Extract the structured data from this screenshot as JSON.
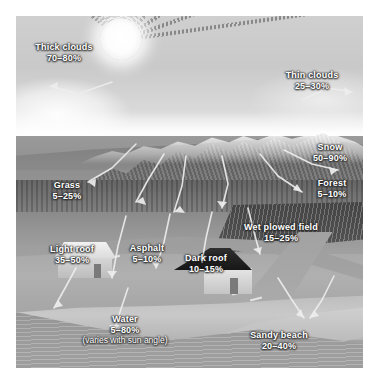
{
  "figure": {
    "top_remnant": "",
    "top_remnant_right": "",
    "sun_name": "sun",
    "sky_name": "sky"
  },
  "labels": [
    {
      "id": "thick-clouds",
      "title": "Thick clouds",
      "value": "70–80%",
      "note": "",
      "x": 26,
      "y": 42,
      "w": 76
    },
    {
      "id": "thin-clouds",
      "title": "Thin clouds",
      "value": "25–30%",
      "note": "",
      "x": 276,
      "y": 70,
      "w": 72
    },
    {
      "id": "snow",
      "title": "Snow",
      "value": "50–90%",
      "note": "",
      "x": 302,
      "y": 142,
      "w": 56
    },
    {
      "id": "forest",
      "title": "Forest",
      "value": "5–10%",
      "note": "",
      "x": 304,
      "y": 178,
      "w": 56
    },
    {
      "id": "grass",
      "title": "Grass",
      "value": "5–25%",
      "note": "",
      "x": 38,
      "y": 180,
      "w": 58
    },
    {
      "id": "wet-plowed-field",
      "title": "Wet plowed field",
      "value": "15–25%",
      "note": "",
      "x": 234,
      "y": 222,
      "w": 94
    },
    {
      "id": "light-roof",
      "title": "Light roof",
      "value": "35–50%",
      "note": "",
      "x": 40,
      "y": 244,
      "w": 64
    },
    {
      "id": "asphalt",
      "title": "Asphalt",
      "value": "5–10%",
      "note": "",
      "x": 118,
      "y": 243,
      "w": 58
    },
    {
      "id": "dark-roof",
      "title": "Dark roof",
      "value": "10–15%",
      "note": "",
      "x": 174,
      "y": 253,
      "w": 64
    },
    {
      "id": "water",
      "title": "Water",
      "value": "5–80%",
      "note": "(varies with sun angle)",
      "x": 62,
      "y": 314,
      "w": 126
    },
    {
      "id": "sandy-beach",
      "title": "Sandy beach",
      "value": "20–40%",
      "note": "",
      "x": 238,
      "y": 330,
      "w": 82
    }
  ],
  "chart_data": {
    "type": "table",
    "xlabel": "Surface",
    "ylabel": "Albedo (% of incoming sunlight reflected)",
    "unit": "%",
    "categories": [
      "Thick clouds",
      "Thin clouds",
      "Snow",
      "Forest",
      "Grass",
      "Wet plowed field",
      "Light roof",
      "Asphalt",
      "Dark roof",
      "Water",
      "Sandy beach"
    ],
    "ranges": [
      [
        70,
        80
      ],
      [
        25,
        30
      ],
      [
        50,
        90
      ],
      [
        5,
        10
      ],
      [
        5,
        25
      ],
      [
        15,
        25
      ],
      [
        35,
        50
      ],
      [
        5,
        10
      ],
      [
        10,
        15
      ],
      [
        5,
        80
      ],
      [
        20,
        40
      ]
    ],
    "range_labels": [
      "70–80%",
      "25–30%",
      "50–90%",
      "5–10%",
      "5–25%",
      "15–25%",
      "35–50%",
      "5–10%",
      "10–15%",
      "5–80%",
      "20–40%"
    ],
    "annotations": [
      "Water 5–80% (varies with sun angle)"
    ],
    "ylim": [
      0,
      100
    ],
    "grid": false,
    "legend": "none"
  }
}
